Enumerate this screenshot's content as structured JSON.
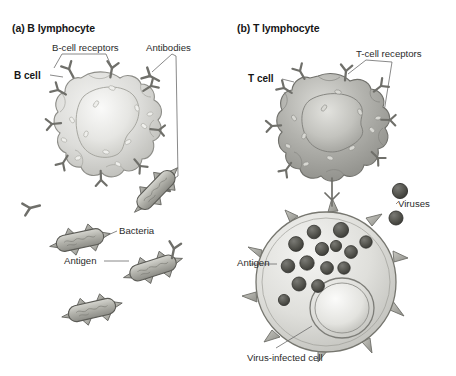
{
  "figure": {
    "background_color": "#ffffff",
    "width": 456,
    "height": 376
  },
  "panels": [
    {
      "id": "a",
      "heading": "(a) B lymphocyte",
      "cell_label": "B cell",
      "callouts": [
        {
          "name": "b-cell-receptors",
          "text": "B-cell receptors"
        },
        {
          "name": "antibodies",
          "text": "Antibodies"
        },
        {
          "name": "bacteria",
          "text": "Bacteria"
        },
        {
          "name": "antigen",
          "text": "Antigen"
        }
      ]
    },
    {
      "id": "b",
      "heading": "(b) T lymphocyte",
      "cell_label": "T cell",
      "callouts": [
        {
          "name": "t-cell-receptors",
          "text": "T-cell receptors"
        },
        {
          "name": "viruses",
          "text": "Viruses"
        },
        {
          "name": "antigen",
          "text": "Antigen"
        },
        {
          "name": "virus-infected-cell",
          "text": "Virus-infected cell"
        }
      ]
    }
  ],
  "colors": {
    "ink": "#161616",
    "label_text": "#2b2b2b",
    "leader_line": "#6b6b6b",
    "b_cell_fill_light": "#e8e8e6",
    "b_cell_fill_mid": "#cfcfcc",
    "b_cell_outline": "#8a8a86",
    "t_cell_fill_light": "#c9c9c5",
    "t_cell_fill_mid": "#9a9a95",
    "t_cell_outline": "#6e6e6a",
    "bacteria_fill": "#b5b5ae",
    "bacteria_outline": "#5e5e59",
    "virus_fill": "#5a5a56",
    "virus_outline": "#3a3a37",
    "infected_cell_fill": "#dcdcd8",
    "infected_cell_outline": "#7d7d78"
  },
  "counts": {
    "b_cell_receptors_on_membrane": 9,
    "free_antibodies": 3,
    "bacteria": 4,
    "free_viruses": 2,
    "viruses_inside_infected_cell": 14,
    "t_cell_receptors_on_membrane": 8
  }
}
